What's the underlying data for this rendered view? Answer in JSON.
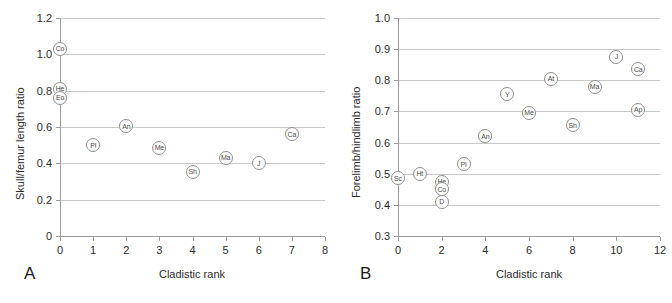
{
  "figure": {
    "panel_a_letter": "A",
    "panel_b_letter": "B"
  },
  "chart_data": [
    {
      "type": "scatter",
      "panel": "A",
      "title": "",
      "xlabel": "Cladistic rank",
      "ylabel": "Skull/femur length ratio",
      "xlim": [
        0,
        8
      ],
      "ylim": [
        0,
        1.2
      ],
      "xticks": [
        "0",
        "1",
        "2",
        "3",
        "4",
        "5",
        "6",
        "7",
        "8"
      ],
      "xtick_values": [
        0,
        1,
        2,
        3,
        4,
        5,
        6,
        7,
        8
      ],
      "yticks": [
        "0",
        "0.2",
        "0.4",
        "0.6",
        "0.8",
        "1.0",
        "1.2"
      ],
      "ytick_values": [
        0,
        0.2,
        0.4,
        0.6,
        0.8,
        1.0,
        1.2
      ],
      "grid": "horizontal",
      "legend": "none",
      "marker_style": "open-circle-with-label",
      "points": [
        {
          "label": "Co",
          "x": 0,
          "y": 1.03
        },
        {
          "label": "He",
          "x": 0,
          "y": 0.81
        },
        {
          "label": "Eo",
          "x": 0,
          "y": 0.76
        },
        {
          "label": "Pl",
          "x": 1,
          "y": 0.5
        },
        {
          "label": "An",
          "x": 2,
          "y": 0.605
        },
        {
          "label": "Me",
          "x": 3,
          "y": 0.485
        },
        {
          "label": "Sh",
          "x": 4,
          "y": 0.355
        },
        {
          "label": "Ma",
          "x": 5,
          "y": 0.43
        },
        {
          "label": "J",
          "x": 6,
          "y": 0.4
        },
        {
          "label": "Ca",
          "x": 7,
          "y": 0.56
        }
      ]
    },
    {
      "type": "scatter",
      "panel": "B",
      "title": "",
      "xlabel": "Cladistic rank",
      "ylabel": "Forelimb/hindlimb ratio",
      "xlim": [
        0,
        12
      ],
      "ylim": [
        0.3,
        1.0
      ],
      "xticks": [
        "0",
        "2",
        "4",
        "6",
        "8",
        "10",
        "12"
      ],
      "xtick_values": [
        0,
        2,
        4,
        6,
        8,
        10,
        12
      ],
      "yticks": [
        "0.3",
        "0.4",
        "0.5",
        "0.6",
        "0.7",
        "0.8",
        "0.9",
        "1.0"
      ],
      "ytick_values": [
        0.3,
        0.4,
        0.5,
        0.6,
        0.7,
        0.8,
        0.9,
        1.0
      ],
      "grid": "horizontal",
      "legend": "none",
      "marker_style": "open-circle-with-label",
      "points": [
        {
          "label": "Sc",
          "x": 0,
          "y": 0.485
        },
        {
          "label": "Ht",
          "x": 1,
          "y": 0.5
        },
        {
          "label": "He",
          "x": 2,
          "y": 0.475
        },
        {
          "label": "Co",
          "x": 2,
          "y": 0.45
        },
        {
          "label": "D",
          "x": 2,
          "y": 0.41
        },
        {
          "label": "Pl",
          "x": 3,
          "y": 0.53
        },
        {
          "label": "An",
          "x": 4,
          "y": 0.62
        },
        {
          "label": "Y",
          "x": 5,
          "y": 0.755
        },
        {
          "label": "Me",
          "x": 6,
          "y": 0.695
        },
        {
          "label": "At",
          "x": 7,
          "y": 0.805
        },
        {
          "label": "Sh",
          "x": 8,
          "y": 0.655
        },
        {
          "label": "Ma",
          "x": 9,
          "y": 0.78
        },
        {
          "label": "J",
          "x": 10,
          "y": 0.875
        },
        {
          "label": "Ca",
          "x": 11,
          "y": 0.835
        },
        {
          "label": "Ap",
          "x": 11,
          "y": 0.705
        }
      ]
    }
  ],
  "colors": {
    "marker_outline": "#8e8e8e",
    "marker_text": "#4a4a4a",
    "gridline": "#c9c9c9",
    "axis": "#9a9a9a",
    "text": "#2b2b2b"
  }
}
